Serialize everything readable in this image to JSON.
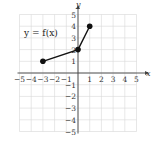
{
  "chart_data": {
    "type": "line",
    "title": "",
    "annotation": "y = f(x)",
    "xlabel": "x",
    "ylabel": "y",
    "xlim": [
      -5,
      5
    ],
    "ylim": [
      -5,
      5
    ],
    "grid": true,
    "x_ticks": [
      "−5",
      "−4",
      "−3",
      "−2",
      "−1",
      "1",
      "2",
      "3",
      "4",
      "5"
    ],
    "y_ticks": [
      "5",
      "4",
      "3",
      "2",
      "1",
      "−1",
      "−2",
      "−3",
      "−4",
      "−5"
    ],
    "series": [
      {
        "name": "f(x)",
        "points": [
          [
            -3,
            1
          ],
          [
            0,
            2
          ],
          [
            1,
            4
          ]
        ],
        "endpoints": "closed",
        "color": "#111111"
      }
    ]
  }
}
